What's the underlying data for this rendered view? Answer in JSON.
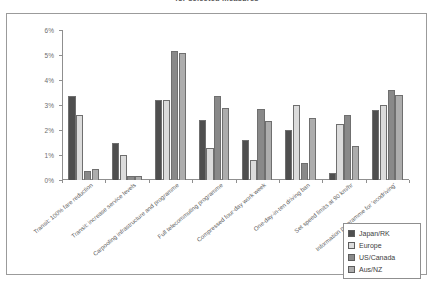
{
  "chart_title": "for selected measures",
  "legend": {
    "position": "bottom-right",
    "items": [
      {
        "label": "Japan/RK",
        "color": "#4f4f4f"
      },
      {
        "label": "Europe",
        "color": "#dcdcdc"
      },
      {
        "label": "US/Canada",
        "color": "#898989"
      },
      {
        "label": "Aus/NZ",
        "color": "#adadad"
      }
    ]
  },
  "chart_data": {
    "type": "bar",
    "title": "for selected measures",
    "xlabel": "",
    "ylabel": "",
    "ylim": [
      0,
      6
    ],
    "ytick_labels": [
      "0%",
      "1%",
      "2%",
      "3%",
      "4%",
      "5%",
      "6%"
    ],
    "ytick_values": [
      0,
      1,
      2,
      3,
      4,
      5,
      6
    ],
    "grid": false,
    "legend_position": "bottom-right",
    "categories": [
      "Transit: 100% fare reduction",
      "Transit: increase service levels",
      "Carpooling infrastructure and programme",
      "Full telecommuting programme",
      "Compressed four-day work week",
      "One-day-in-ten driving ban",
      "Set speed limits at 90 km/hr",
      "Information programme for 'ecodriving'"
    ],
    "series": [
      {
        "name": "Japan/RK",
        "color": "#4f4f4f",
        "values": [
          3.35,
          1.5,
          3.2,
          2.4,
          1.6,
          2.0,
          0.3,
          2.8
        ]
      },
      {
        "name": "Europe",
        "color": "#dcdcdc",
        "values": [
          2.6,
          1.0,
          3.2,
          1.3,
          0.8,
          3.0,
          2.25,
          3.0
        ]
      },
      {
        "name": "US/Canada",
        "color": "#898989",
        "values": [
          0.35,
          0.15,
          5.15,
          3.35,
          2.85,
          0.7,
          2.6,
          3.6
        ]
      },
      {
        "name": "Aus/NZ",
        "color": "#adadad",
        "values": [
          0.45,
          0.15,
          5.1,
          2.9,
          2.35,
          2.5,
          1.35,
          3.4
        ]
      }
    ]
  }
}
